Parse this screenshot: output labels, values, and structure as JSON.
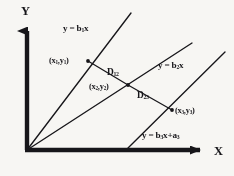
{
  "figure": {
    "background_color": "#f7f6f3",
    "ink_color": "#17161a",
    "axes": {
      "y_label": "Y",
      "x_label": "X",
      "origin": [
        27,
        150
      ],
      "y_top": [
        27,
        28
      ],
      "x_right": [
        205,
        150
      ]
    },
    "lines": [
      {
        "id": "line-1",
        "label": "y = b",
        "label_sub1": "1",
        "label_sub2": "x",
        "equation": "y = b₁x",
        "from_origin": true,
        "x1": 27,
        "y1": 150,
        "x2": 131,
        "y2": 13
      },
      {
        "id": "line-2",
        "label": "y = b",
        "label_sub1": "2",
        "label_sub2": "x",
        "equation": "y = b₂x",
        "from_origin": true,
        "x1": 27,
        "y1": 150,
        "x2": 192,
        "y2": 43
      },
      {
        "id": "line-3",
        "label": "y = b",
        "label_sub1": "3",
        "label_sub2": "x+a",
        "label_sub3": "3",
        "equation": "y = b₃x+a₃",
        "from_origin": false,
        "x1": 128,
        "y1": 148,
        "x2": 225,
        "y2": 52
      }
    ],
    "points": [
      {
        "id": "p1",
        "label": "(x",
        "sub1": "1",
        "mid": ",y",
        "sub2": "1",
        "close": ")",
        "text": "(x₁,y₁)",
        "x": 88,
        "y": 61
      },
      {
        "id": "p2",
        "label": "(x",
        "sub1": "2",
        "mid": ",y",
        "sub2": "2",
        "close": ")",
        "text": "(x₂,y₂)",
        "x": 128,
        "y": 85
      },
      {
        "id": "p3",
        "label": "(x",
        "sub1": "3",
        "mid": ",y",
        "sub2": "3",
        "close": ")",
        "text": "(x₃,y₃)",
        "x": 172,
        "y": 110
      }
    ],
    "distances": [
      {
        "id": "d12",
        "label": "D",
        "sub": "12",
        "text": "D₁₂",
        "from": "p1",
        "to": "p2"
      },
      {
        "id": "d23",
        "label": "D",
        "sub": "23",
        "text": "D₂₃",
        "from": "p2",
        "to": "p3"
      }
    ]
  }
}
